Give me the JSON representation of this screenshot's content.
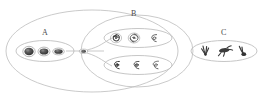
{
  "diagram": {
    "background_color": "#ffffff",
    "outline_color": "#b0b0b0",
    "edge_color": "#a8a8a8",
    "object_color": "#4a4a4a",
    "label_color": "#4a4a4a"
  },
  "labels": {
    "a": "A",
    "b": "B",
    "c": "C"
  },
  "clusters": [
    {
      "id": "A",
      "label": "A",
      "kind": "elliptical-galaxies",
      "member_count": 3,
      "members": [
        "elliptical-1",
        "elliptical-2",
        "elliptical-3"
      ]
    },
    {
      "id": "B",
      "label": "B",
      "kind": "spiral-galaxies",
      "member_count": 6,
      "subgroups": [
        {
          "id": "B1",
          "member_count": 3,
          "members": [
            "spiral-1",
            "spiral-2",
            "spiral-3"
          ]
        },
        {
          "id": "B2",
          "member_count": 3,
          "members": [
            "spiral-4",
            "spiral-5",
            "spiral-6"
          ]
        }
      ]
    },
    {
      "id": "C",
      "label": "C",
      "kind": "irregular-galaxies",
      "member_count": 3,
      "members": [
        "irregular-1",
        "irregular-2",
        "irregular-3"
      ]
    }
  ],
  "root_node": {
    "id": "root",
    "label": ""
  }
}
